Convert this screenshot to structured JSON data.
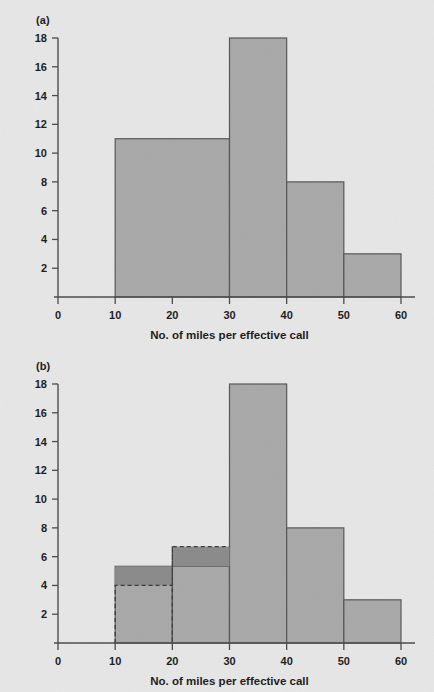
{
  "figure": {
    "background_color": "#e6e6e6",
    "bar_fill_color": "#a8a8a8",
    "bar_stroke_color": "#555555",
    "overlay_fill_color": "#8a8a8a",
    "axis_color": "#4a4a4a",
    "text_color": "#1a1a1a"
  },
  "panels": [
    {
      "id": "a",
      "label": "(a)",
      "chart_data": {
        "type": "bar",
        "title": "",
        "xlabel": "No. of miles per effective call",
        "ylabel": "",
        "xlim": [
          0,
          60
        ],
        "ylim": [
          0,
          18
        ],
        "grid": false,
        "legend": null,
        "xticks": [
          "0",
          "10",
          "20",
          "30",
          "40",
          "50",
          "60"
        ],
        "xtick_values": [
          0,
          10,
          20,
          30,
          40,
          50,
          60
        ],
        "yticks": [
          "2",
          "4",
          "6",
          "8",
          "10",
          "12",
          "14",
          "16",
          "18"
        ],
        "ytick_values": [
          2,
          4,
          6,
          8,
          10,
          12,
          14,
          16,
          18
        ],
        "bins": [
          {
            "x0": 10,
            "x1": 30,
            "value": 11
          },
          {
            "x0": 30,
            "x1": 40,
            "value": 18
          },
          {
            "x0": 40,
            "x1": 50,
            "value": 8
          },
          {
            "x0": 50,
            "x1": 60,
            "value": 3
          }
        ]
      }
    },
    {
      "id": "b",
      "label": "(b)",
      "chart_data": {
        "type": "bar",
        "title": "",
        "xlabel": "No. of miles per effective call",
        "ylabel": "",
        "xlim": [
          0,
          60
        ],
        "ylim": [
          0,
          18
        ],
        "grid": false,
        "legend": null,
        "xticks": [
          "0",
          "10",
          "20",
          "30",
          "40",
          "50",
          "60"
        ],
        "xtick_values": [
          0,
          10,
          20,
          30,
          40,
          50,
          60
        ],
        "yticks": [
          "2",
          "4",
          "6",
          "8",
          "10",
          "12",
          "14",
          "16",
          "18"
        ],
        "ytick_values": [
          2,
          4,
          6,
          8,
          10,
          12,
          14,
          16,
          18
        ],
        "bins": [
          {
            "x0": 10,
            "x1": 20,
            "value": 5.33
          },
          {
            "x0": 20,
            "x1": 30,
            "value": 5.33
          },
          {
            "x0": 30,
            "x1": 40,
            "value": 18
          },
          {
            "x0": 40,
            "x1": 50,
            "value": 8
          },
          {
            "x0": 50,
            "x1": 60,
            "value": 3
          }
        ],
        "overlay_bins": [
          {
            "x0": 10,
            "x1": 20,
            "value": 4.0
          },
          {
            "x0": 20,
            "x1": 30,
            "value": 6.7
          }
        ],
        "overlay_note": "dashed outline marks original unequal-width class frequencies"
      }
    }
  ]
}
